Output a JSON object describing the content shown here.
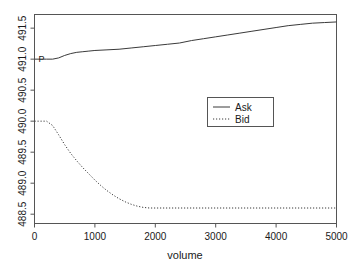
{
  "chart_data": {
    "type": "line",
    "title": "",
    "subtitle": "",
    "xlabel": "volume",
    "ylabel": "",
    "xlim": [
      0,
      5000
    ],
    "ylim": [
      488.35,
      491.72
    ],
    "grid": false,
    "legend_position": "center",
    "xticks": [
      0,
      1000,
      2000,
      3000,
      4000,
      5000
    ],
    "xticklabels": [
      "0",
      "1000",
      "2000",
      "3000",
      "4000",
      "5000"
    ],
    "yticks": [
      488.5,
      489.0,
      489.5,
      490.0,
      490.5,
      491.0,
      491.5
    ],
    "yticklabels": [
      "488.5",
      "489.0",
      "489.5",
      "490.0",
      "490.5",
      "491.0",
      "491.5"
    ],
    "annotations": [
      {
        "text": "P",
        "x": 0,
        "y": 491.0
      }
    ],
    "series": [
      {
        "name": "Ask",
        "style": "solid",
        "color": "#3a3a3a",
        "x": [
          0,
          100,
          200,
          300,
          400,
          500,
          600,
          700,
          800,
          900,
          1000,
          1200,
          1400,
          1600,
          1800,
          2000,
          2200,
          2400,
          2600,
          2800,
          3000,
          3200,
          3400,
          3600,
          3800,
          4000,
          4200,
          4400,
          4600,
          4800,
          5000
        ],
        "y": [
          491.0,
          491.0,
          491.0,
          491.0,
          491.02,
          491.06,
          491.09,
          491.11,
          491.12,
          491.13,
          491.14,
          491.15,
          491.16,
          491.18,
          491.2,
          491.22,
          491.24,
          491.26,
          491.3,
          491.33,
          491.36,
          491.39,
          491.42,
          491.45,
          491.48,
          491.51,
          491.54,
          491.56,
          491.58,
          491.59,
          491.6
        ]
      },
      {
        "name": "Bid",
        "style": "dotted",
        "color": "#3a3a3a",
        "x": [
          0,
          100,
          200,
          300,
          400,
          500,
          600,
          700,
          800,
          900,
          1000,
          1100,
          1200,
          1300,
          1400,
          1500,
          1600,
          1700,
          1800,
          1900,
          2000,
          2500,
          3000,
          3500,
          4000,
          4500,
          5000
        ],
        "y": [
          490.0,
          490.0,
          490.0,
          489.93,
          489.78,
          489.62,
          489.48,
          489.36,
          489.25,
          489.15,
          489.05,
          488.96,
          488.88,
          488.81,
          488.75,
          488.7,
          488.66,
          488.63,
          488.61,
          488.6,
          488.6,
          488.6,
          488.6,
          488.6,
          488.6,
          488.6,
          488.6
        ]
      }
    ],
    "legend": [
      {
        "label": "Ask",
        "style": "solid"
      },
      {
        "label": "Bid",
        "style": "dotted"
      }
    ]
  }
}
